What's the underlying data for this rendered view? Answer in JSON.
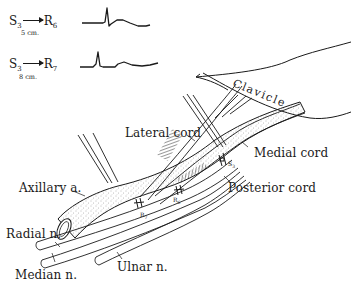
{
  "figure": {
    "type": "anatomical-line-drawing"
  },
  "recordings": [
    {
      "stimulus": "S",
      "stimulus_sub": "3",
      "recording": "R",
      "recording_sub": "6",
      "distance": "5 cm.",
      "waveform": "biphasic spike with late slow wave"
    },
    {
      "stimulus": "S",
      "stimulus_sub": "3",
      "recording": "R",
      "recording_sub": "7",
      "distance": "8 cm.",
      "waveform": "biphasic spike with late slow wave"
    }
  ],
  "labels": {
    "clavicle": "Clavicle",
    "lateral_cord": "Lateral cord",
    "medial_cord": "Medial cord",
    "posterior_cord": "Posterior cord",
    "axillary_artery": "Axillary a.",
    "radial_nerve": "Radial n.",
    "median_nerve": "Median n.",
    "ulnar_nerve": "Ulnar n."
  },
  "electrodes": {
    "stimulus": "S3",
    "stimulus_main": "S",
    "stimulus_sub": "3",
    "r6_main": "R",
    "r6_sub": "6",
    "r7_main": "R",
    "r7_sub": "7"
  },
  "colors": {
    "ink": "#1a1a1a",
    "paper": "#ffffff",
    "stipple": "#777777"
  }
}
